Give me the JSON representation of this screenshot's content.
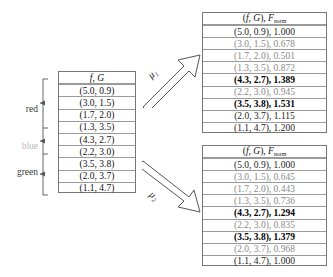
{
  "figure": {
    "source_table": {
      "header": "(f, G)",
      "rows": [
        {
          "pair": "(5.0, 0.9)",
          "emphasis": "normal"
        },
        {
          "pair": "(3.0, 1.5)",
          "emphasis": "normal"
        },
        {
          "pair": "(1.7, 2.0)",
          "emphasis": "normal"
        },
        {
          "pair": "(1.3, 3.5)",
          "emphasis": "normal"
        },
        {
          "pair": "(4.3, 2.7)",
          "emphasis": "normal"
        },
        {
          "pair": "(2.2, 3.0)",
          "emphasis": "normal"
        },
        {
          "pair": "(3.5, 3.8)",
          "emphasis": "normal"
        },
        {
          "pair": "(2.0, 3.7)",
          "emphasis": "normal"
        },
        {
          "pair": "(1.1, 4.7)",
          "emphasis": "normal"
        }
      ]
    },
    "groups": [
      {
        "name": "red",
        "color": "#3a3a3a",
        "rows": 4
      },
      {
        "name": "blue",
        "color": "#b9b9b9",
        "rows": 2
      },
      {
        "name": "green",
        "color": "#3a3a3a",
        "rows": 3
      }
    ],
    "arrows": [
      {
        "label": "μ₁",
        "direction": "up-right"
      },
      {
        "label": "μ₂",
        "direction": "down-right"
      }
    ],
    "result_tables": [
      {
        "id": "top",
        "header_pair": "(f, G)",
        "header_metric": "F",
        "header_metric_sub": "norm",
        "rows": [
          {
            "pair": "(5.0, 0.9)",
            "value": "1.000",
            "emphasis": "normal"
          },
          {
            "pair": "(3.0, 1.5)",
            "value": "0.678",
            "emphasis": "dim"
          },
          {
            "pair": "(1.7, 2.0)",
            "value": "0.501",
            "emphasis": "dim"
          },
          {
            "pair": "(1.3, 3.5)",
            "value": "0.872",
            "emphasis": "dim"
          },
          {
            "pair": "(4.3, 2.7)",
            "value": "1.389",
            "emphasis": "bold"
          },
          {
            "pair": "(2.2, 3.0)",
            "value": "0.945",
            "emphasis": "dim"
          },
          {
            "pair": "(3.5, 3.8)",
            "value": "1.531",
            "emphasis": "bold"
          },
          {
            "pair": "(2.0, 3.7)",
            "value": "1.115",
            "emphasis": "normal"
          },
          {
            "pair": "(1.1, 4.7)",
            "value": "1.200",
            "emphasis": "normal"
          }
        ]
      },
      {
        "id": "bottom",
        "header_pair": "(f, G)",
        "header_metric": "F",
        "header_metric_sub": "norm",
        "rows": [
          {
            "pair": "(5.0, 0.9)",
            "value": "1.000",
            "emphasis": "normal"
          },
          {
            "pair": "(3.0, 1.5)",
            "value": "0.645",
            "emphasis": "dim"
          },
          {
            "pair": "(1.7, 2.0)",
            "value": "0.443",
            "emphasis": "dim"
          },
          {
            "pair": "(1.3, 3.5)",
            "value": "0.736",
            "emphasis": "dim"
          },
          {
            "pair": "(4.3, 2.7)",
            "value": "1.294",
            "emphasis": "bold"
          },
          {
            "pair": "(2.2, 3.0)",
            "value": "0.835",
            "emphasis": "dim"
          },
          {
            "pair": "(3.5, 3.8)",
            "value": "1.379",
            "emphasis": "bold"
          },
          {
            "pair": "(2.0, 3.7)",
            "value": "0.968",
            "emphasis": "dim"
          },
          {
            "pair": "(1.1, 4.7)",
            "value": "1.000",
            "emphasis": "normal"
          }
        ]
      }
    ]
  }
}
